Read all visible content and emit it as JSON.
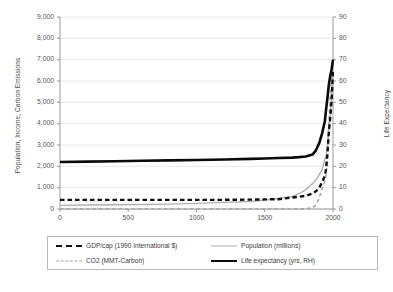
{
  "chart_data": {
    "type": "line",
    "title": "",
    "xlabel": "",
    "ylabel": "Population, Income, Carbon Emissions",
    "y2label": "Life Expectancy",
    "xlim": [
      0,
      2000
    ],
    "ylim": [
      0,
      9000
    ],
    "y2lim": [
      0,
      90
    ],
    "grid": true,
    "legend_position": "bottom",
    "x_ticks": [
      "0",
      "500",
      "1000",
      "1500",
      "2000"
    ],
    "x_tick_values": [
      0,
      500,
      1000,
      1500,
      2000
    ],
    "y_ticks": [
      "0",
      "1,000",
      "2,000",
      "3,000",
      "4,000",
      "5,000",
      "6,000",
      "7,000",
      "8,000",
      "9,000"
    ],
    "y_tick_values": [
      0,
      1000,
      2000,
      3000,
      4000,
      5000,
      6000,
      7000,
      8000,
      9000
    ],
    "y2_ticks": [
      "0",
      "10",
      "20",
      "30",
      "40",
      "50",
      "60",
      "70",
      "80",
      "90"
    ],
    "y2_tick_values": [
      0,
      10,
      20,
      30,
      40,
      50,
      60,
      70,
      80,
      90
    ],
    "x": [
      0,
      200,
      400,
      600,
      800,
      1000,
      1200,
      1400,
      1500,
      1600,
      1700,
      1750,
      1800,
      1850,
      1875,
      1900,
      1920,
      1940,
      1950,
      1960,
      1970,
      1980,
      1990,
      2000
    ],
    "series": [
      {
        "name": "GDP/cap (1990 International $)",
        "axis": "left",
        "style": "dashed",
        "color": "#111111",
        "width": 2.4,
        "values": [
          430,
          430,
          430,
          430,
          430,
          430,
          430,
          440,
          450,
          460,
          540,
          570,
          620,
          720,
          830,
          1000,
          1250,
          1550,
          1900,
          2650,
          3650,
          4300,
          5100,
          6500
        ]
      },
      {
        "name": "Population (millions)",
        "axis": "left",
        "style": "solid",
        "color": "#b0b0b0",
        "width": 1.4,
        "values": [
          170,
          190,
          200,
          210,
          230,
          265,
          310,
          350,
          425,
          490,
          580,
          720,
          900,
          1200,
          1350,
          1625,
          1850,
          2300,
          2520,
          3020,
          3690,
          4440,
          5270,
          6080
        ]
      },
      {
        "name": "CO2 (MMT-Carbon)",
        "axis": "left",
        "style": "dashed",
        "color": "#a6a6a6",
        "width": 1.6,
        "values": [
          0,
          0,
          0,
          0,
          0,
          0,
          0,
          0,
          0,
          0,
          3,
          6,
          8,
          54,
          188,
          534,
          940,
          1300,
          1630,
          2570,
          4050,
          5260,
          6140,
          6750
        ]
      },
      {
        "name": "Life expectancy (yrs, RH)",
        "axis": "right",
        "style": "solid",
        "color": "#0a0a0a",
        "width": 2.6,
        "values": [
          22,
          22.2,
          22.4,
          22.6,
          22.8,
          23,
          23.2,
          23.5,
          23.7,
          23.9,
          24.1,
          24.3,
          24.6,
          25.5,
          27.5,
          31,
          35.5,
          41,
          47,
          52.5,
          58.5,
          62.5,
          65.5,
          70
        ]
      }
    ]
  },
  "legend": {
    "entries": [
      {
        "label": "GDP/cap (1990 International $)",
        "swatch": "dashed-black"
      },
      {
        "label": "Population (millions)",
        "swatch": "solid-gray"
      },
      {
        "label": "CO2 (MMT-Carbon)",
        "swatch": "dashed-gray"
      },
      {
        "label": "Life expectancy (yrs, RH)",
        "swatch": "solid-black"
      }
    ]
  },
  "colors": {
    "gdp": "#111111",
    "population": "#b0b0b0",
    "co2": "#a6a6a6",
    "life_expectancy": "#0a0a0a",
    "grid": "#e2e2e2",
    "axis": "#9a9a9a",
    "legend_border": "#b8b8b8"
  }
}
